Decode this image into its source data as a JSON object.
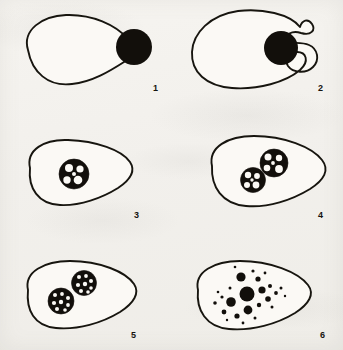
{
  "figure": {
    "panel_count": 6,
    "background_color": "#f4f2ee",
    "ink_color": "#120f0b"
  },
  "panels": [
    {
      "label": "1",
      "label_x": 153,
      "label_y": 84,
      "caption": "Amoeba approaches free food particle",
      "cell": {
        "shape": "pear",
        "path": "M 28 50 C 22 30, 42 16, 66 15 C 92 14, 116 25, 128 39 C 136 48, 133 56, 124 62 C 110 71, 92 82, 72 84 C 48 87, 32 72, 28 50 Z",
        "cx": 78,
        "cy": 48
      },
      "particles": [
        {
          "cx": 134,
          "cy": 47,
          "r": 18
        }
      ],
      "vacuoles": []
    },
    {
      "label": "2",
      "label_x": 318,
      "label_y": 84,
      "caption": "Pseudopods extend around the particle",
      "cell": {
        "shape": "c-cup",
        "path": "M 300 27 C 290 14, 262 8, 238 11 C 210 15, 193 33, 192 52 C 191 72, 206 86, 232 88 C 258 90, 286 82, 300 70 C 310 61, 306 52, 297 52 C 288 52, 284 60, 288 66 C 293 73, 306 74, 313 67 C 320 60, 318 49, 309 45 C 300 41, 288 45, 286 40 C 284 35, 292 30, 301 33 C 311 36, 316 30, 312 24 C 308 18, 302 20, 300 27 Z",
        "cx": 248,
        "cy": 50
      },
      "particles": [
        {
          "cx": 281,
          "cy": 48,
          "r": 17
        }
      ],
      "vacuoles": []
    },
    {
      "label": "3",
      "label_x": 134,
      "label_y": 211,
      "caption": "Food vacuole formed inside cytoplasm",
      "cell": {
        "shape": "blob-tapered-right",
        "path": "M 30 168 C 26 150, 44 139, 68 140 C 96 141, 122 150, 130 162 C 136 171, 130 180, 118 188 C 102 198, 80 206, 60 205 C 38 204, 28 188, 30 168 Z",
        "cx": 75,
        "cy": 172
      },
      "particles": [],
      "vacuoles": [
        {
          "cx": 74,
          "cy": 174,
          "r": 15,
          "vesicles": [
            {
              "cx": 69,
              "cy": 168,
              "r": 4.0
            },
            {
              "cx": 80,
              "cy": 169,
              "r": 3.6
            },
            {
              "cx": 67,
              "cy": 180,
              "r": 3.7
            },
            {
              "cx": 78,
              "cy": 180,
              "r": 4.3
            },
            {
              "cx": 74,
              "cy": 174,
              "r": 2.0
            }
          ]
        }
      ]
    },
    {
      "label": "4",
      "label_x": 318,
      "label_y": 211,
      "caption": "Vacuole divides into two digestive vacuoles",
      "cell": {
        "shape": "blob-tapered-right",
        "path": "M 212 166 C 208 147, 228 136, 254 136 C 284 136, 312 147, 322 160 C 330 170, 324 180, 310 189 C 292 200, 268 208, 246 206 C 222 204, 211 187, 212 166 Z",
        "cx": 262,
        "cy": 170
      },
      "particles": [],
      "vacuoles": [
        {
          "cx": 253,
          "cy": 180,
          "r": 12.5,
          "vesicles": [
            {
              "cx": 248,
              "cy": 175,
              "r": 3.2
            },
            {
              "cx": 257,
              "cy": 176,
              "r": 2.9
            },
            {
              "cx": 247,
              "cy": 185,
              "r": 3.0
            },
            {
              "cx": 256,
              "cy": 185,
              "r": 3.4
            },
            {
              "cx": 252,
              "cy": 180,
              "r": 1.7
            }
          ]
        },
        {
          "cx": 274,
          "cy": 163,
          "r": 14,
          "vesicles": [
            {
              "cx": 268,
              "cy": 157,
              "r": 3.5
            },
            {
              "cx": 279,
              "cy": 158,
              "r": 3.2
            },
            {
              "cx": 267,
              "cy": 168,
              "r": 3.3
            },
            {
              "cx": 279,
              "cy": 169,
              "r": 3.9
            },
            {
              "cx": 273,
              "cy": 163,
              "r": 1.9
            }
          ]
        }
      ]
    },
    {
      "label": "5",
      "label_x": 131,
      "label_y": 331,
      "caption": "Vacuoles separate as digestion proceeds",
      "cell": {
        "shape": "blob-tapered-right",
        "path": "M 28 290 C 24 272, 44 261, 70 261 C 100 261, 126 272, 134 284 C 140 293, 134 303, 120 312 C 102 323, 78 330, 56 328 C 34 326, 26 310, 28 290 Z",
        "cx": 78,
        "cy": 294
      },
      "particles": [],
      "vacuoles": [
        {
          "cx": 61,
          "cy": 301,
          "r": 13,
          "vesicles": [
            {
              "cx": 55,
              "cy": 295,
              "r": 2.0
            },
            {
              "cx": 62,
              "cy": 294,
              "r": 1.9
            },
            {
              "cx": 68,
              "cy": 298,
              "r": 2.0
            },
            {
              "cx": 54,
              "cy": 303,
              "r": 2.1
            },
            {
              "cx": 61,
              "cy": 302,
              "r": 2.2
            },
            {
              "cx": 68,
              "cy": 305,
              "r": 1.9
            },
            {
              "cx": 57,
              "cy": 309,
              "r": 2.0
            },
            {
              "cx": 65,
              "cy": 310,
              "r": 1.8
            }
          ]
        },
        {
          "cx": 84,
          "cy": 283,
          "r": 12.5,
          "vesicles": [
            {
              "cx": 79,
              "cy": 277,
              "r": 2.0
            },
            {
              "cx": 86,
              "cy": 276,
              "r": 1.9
            },
            {
              "cx": 91,
              "cy": 281,
              "r": 2.0
            },
            {
              "cx": 78,
              "cy": 285,
              "r": 2.1
            },
            {
              "cx": 85,
              "cy": 284,
              "r": 2.2
            },
            {
              "cx": 91,
              "cy": 288,
              "r": 1.8
            },
            {
              "cx": 81,
              "cy": 291,
              "r": 2.0
            },
            {
              "cx": 88,
              "cy": 292,
              "r": 1.8
            }
          ]
        }
      ]
    },
    {
      "label": "6",
      "label_x": 320,
      "label_y": 331,
      "caption": "Digested material dispersed as granules",
      "cell": {
        "shape": "blob-tapered-right",
        "path": "M 198 290 C 194 272, 214 261, 240 261 C 270 261, 298 272, 308 285 C 315 294, 309 304, 295 313 C 277 324, 252 331, 229 329 C 206 327, 196 310, 198 290 Z",
        "cx": 248,
        "cy": 294
      },
      "particles": [],
      "vacuoles": [],
      "granules": [
        {
          "cx": 247,
          "cy": 294,
          "r": 7.5
        },
        {
          "cx": 241,
          "cy": 277,
          "r": 4.6
        },
        {
          "cx": 231,
          "cy": 302,
          "r": 4.8
        },
        {
          "cx": 248,
          "cy": 310,
          "r": 4.4
        },
        {
          "cx": 262,
          "cy": 290,
          "r": 3.6
        },
        {
          "cx": 258,
          "cy": 279,
          "r": 2.6
        },
        {
          "cx": 268,
          "cy": 299,
          "r": 2.8
        },
        {
          "cx": 224,
          "cy": 312,
          "r": 2.4
        },
        {
          "cx": 237,
          "cy": 316,
          "r": 2.6
        },
        {
          "cx": 259,
          "cy": 305,
          "r": 2.2
        },
        {
          "cx": 270,
          "cy": 286,
          "r": 2.0
        },
        {
          "cx": 276,
          "cy": 293,
          "r": 1.9
        },
        {
          "cx": 215,
          "cy": 303,
          "r": 1.8
        },
        {
          "cx": 222,
          "cy": 297,
          "r": 1.6
        },
        {
          "cx": 230,
          "cy": 288,
          "r": 1.5
        },
        {
          "cx": 253,
          "cy": 271,
          "r": 1.6
        },
        {
          "cx": 265,
          "cy": 273,
          "r": 1.4
        },
        {
          "cx": 281,
          "cy": 288,
          "r": 1.5
        },
        {
          "cx": 272,
          "cy": 307,
          "r": 1.5
        },
        {
          "cx": 243,
          "cy": 323,
          "r": 1.4
        },
        {
          "cx": 255,
          "cy": 318,
          "r": 1.5
        },
        {
          "cx": 218,
          "cy": 292,
          "r": 1.3
        },
        {
          "cx": 235,
          "cy": 267,
          "r": 1.3
        },
        {
          "cx": 285,
          "cy": 296,
          "r": 1.2
        },
        {
          "cx": 227,
          "cy": 320,
          "r": 1.2
        }
      ]
    }
  ]
}
